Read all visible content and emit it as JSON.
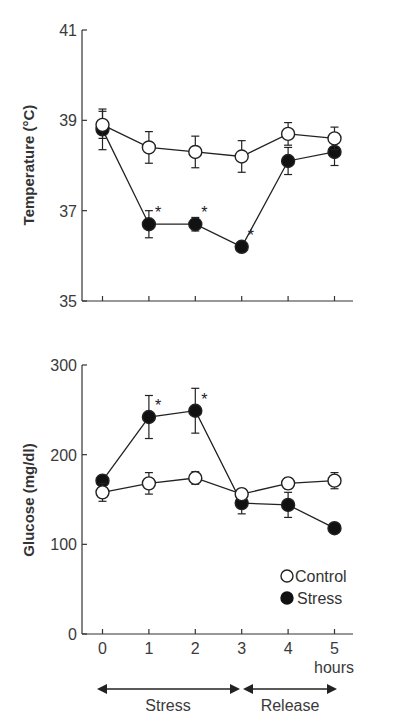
{
  "chart_data": [
    {
      "type": "line",
      "title": "",
      "xlabel": "hours",
      "ylabel": "Temperature (°C)",
      "ylim": [
        35,
        41
      ],
      "yticks": [
        35,
        37,
        39,
        41
      ],
      "x": [
        0,
        1,
        2,
        3,
        4,
        5
      ],
      "grid": false,
      "series": [
        {
          "name": "Control",
          "marker": "open-circle",
          "values": [
            38.9,
            38.4,
            38.3,
            38.2,
            38.7,
            38.6
          ],
          "error": [
            0.3,
            0.35,
            0.35,
            0.35,
            0.25,
            0.25
          ]
        },
        {
          "name": "Stress",
          "marker": "filled-circle",
          "values": [
            38.8,
            36.7,
            36.7,
            36.2,
            38.1,
            38.3
          ],
          "error": [
            0.45,
            0.3,
            0.15,
            0.1,
            0.3,
            0.3
          ]
        }
      ],
      "significance": [
        {
          "series": "Stress",
          "x": 1,
          "label": "*"
        },
        {
          "series": "Stress",
          "x": 2,
          "label": "*"
        },
        {
          "series": "Stress",
          "x": 3,
          "label": "*"
        }
      ]
    },
    {
      "type": "line",
      "title": "",
      "xlabel": "hours",
      "ylabel": "Glucose (mg/dl)",
      "ylim": [
        0,
        300
      ],
      "yticks": [
        0,
        100,
        200,
        300
      ],
      "x": [
        0,
        1,
        2,
        3,
        4,
        5
      ],
      "xticks": [
        "0",
        "1",
        "2",
        "3",
        "4",
        "5"
      ],
      "grid": false,
      "legend_position": "lower right",
      "series": [
        {
          "name": "Control",
          "marker": "open-circle",
          "values": [
            158,
            168,
            174,
            156,
            168,
            171
          ],
          "error": [
            10,
            12,
            7,
            6,
            6,
            9
          ]
        },
        {
          "name": "Stress",
          "marker": "filled-circle",
          "values": [
            171,
            242,
            249,
            146,
            144,
            118
          ],
          "error": [
            5,
            24,
            25,
            12,
            14,
            3
          ]
        }
      ],
      "significance": [
        {
          "series": "Stress",
          "x": 1,
          "label": "*"
        },
        {
          "series": "Stress",
          "x": 2,
          "label": "*"
        }
      ]
    }
  ],
  "temperature_panel": {
    "ylabel": "Temperature (°C)",
    "yticks": [
      "35",
      "37",
      "39",
      "41"
    ]
  },
  "glucose_panel": {
    "ylabel": "Glucose (mg/dl)",
    "yticks": [
      "0",
      "100",
      "200",
      "300"
    ],
    "xticks": [
      "0",
      "1",
      "2",
      "3",
      "4",
      "5"
    ],
    "xunit": "hours"
  },
  "legend": {
    "control": "Control",
    "stress": "Stress"
  },
  "phases": {
    "stress": "Stress",
    "release": "Release"
  },
  "significance_marker": "*"
}
